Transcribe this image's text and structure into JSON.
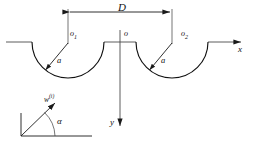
{
  "figure": {
    "type": "diagram",
    "labels": {
      "separation": "D",
      "origin_left": "o",
      "origin_left_sub": "1",
      "origin_center": "o",
      "origin_right": "o",
      "origin_right_sub": "2",
      "radius_left": "a",
      "radius_right": "a",
      "axis_x": "x",
      "axis_y": "y",
      "incident_wave": "w",
      "incident_wave_superscript": "(i)",
      "incident_angle": "α"
    },
    "geometry": {
      "surface_y": 42,
      "left_center_x": 68,
      "right_center_x": 172,
      "center_origin_x": 120,
      "cavity_radius": 36,
      "dimension_line_y": 12,
      "y_axis_end": 128,
      "x_axis_end": 243
    },
    "colors": {
      "stroke": "#111111",
      "axis": "#4a4a4a",
      "background": "#ffffff"
    }
  }
}
